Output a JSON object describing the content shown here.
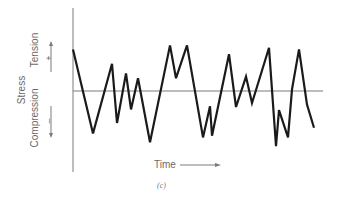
{
  "figure": {
    "caption": "(c)",
    "y_axis_label": "Stress",
    "upper_label": "Tension",
    "lower_label": "Compression",
    "plus_sign": "+",
    "minus_sign": "–",
    "x_axis_label": "Time",
    "colors": {
      "curve": "#1a1a1a",
      "axis": "#7a7a7a",
      "text": "#6a6a6a"
    }
  },
  "chart_data": {
    "type": "line",
    "title": "",
    "xlabel": "Time",
    "ylabel": "Stress",
    "y_regions": {
      "positive": "Tension (+)",
      "negative": "Compression (–)"
    },
    "x": [
      0,
      20,
      39,
      44,
      53,
      58,
      65,
      77,
      97,
      103,
      114,
      130,
      137,
      139,
      156,
      163,
      173,
      179,
      196,
      203,
      206,
      215,
      219,
      226,
      234,
      241
    ],
    "values": [
      0.52,
      -0.53,
      0.34,
      -0.4,
      0.22,
      -0.23,
      0.16,
      -0.64,
      0.57,
      0.16,
      0.57,
      -0.58,
      -0.19,
      -0.56,
      0.46,
      -0.2,
      0.18,
      -0.15,
      0.54,
      -0.69,
      -0.24,
      -0.58,
      0.02,
      0.52,
      -0.17,
      -0.46
    ],
    "ylim": [
      -1,
      1
    ],
    "grid": false,
    "legend": null
  }
}
